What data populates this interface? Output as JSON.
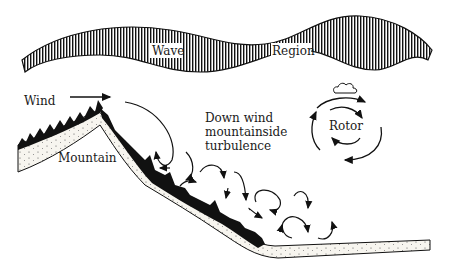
{
  "diagram": {
    "labels": {
      "wave": "Wave",
      "region": "Region",
      "wind": "Wind",
      "mountain": "Mountain",
      "turbulence_line1": "Down wind",
      "turbulence_line2": "mountainside",
      "turbulence_line3": "turbulence",
      "rotor": "Rotor"
    },
    "colors": {
      "ink": "#111111",
      "background": "#ffffff",
      "ground_fill": "#f4f1ea"
    }
  }
}
